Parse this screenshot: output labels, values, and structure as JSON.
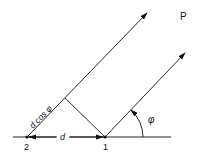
{
  "diagram": {
    "labels": {
      "p": "P",
      "point_1": "1",
      "point_2": "2",
      "distance": "d",
      "projection": "d cos φ",
      "angle": "φ"
    },
    "colors": {
      "line": "#111111",
      "background": "#ffffff"
    }
  }
}
